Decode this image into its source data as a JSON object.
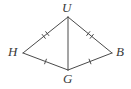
{
  "figure": {
    "type": "geometry-diagram",
    "canvas": {
      "width": 131,
      "height": 89
    },
    "background_color": "#ffffff",
    "stroke_color": "#4a4a4a",
    "label_color": "#3a3a3a",
    "stroke_width": 1,
    "vertices": [
      {
        "id": "U",
        "label": "U",
        "x": 68,
        "y": 17,
        "label_x": 62,
        "label_y": 1
      },
      {
        "id": "H",
        "label": "H",
        "x": 23,
        "y": 53,
        "label_x": 8,
        "label_y": 45
      },
      {
        "id": "B",
        "label": "B",
        "x": 112,
        "y": 53,
        "label_x": 116,
        "label_y": 45
      },
      {
        "id": "G",
        "label": "G",
        "x": 68,
        "y": 70,
        "label_x": 63,
        "label_y": 72
      }
    ],
    "segments": [
      {
        "id": "HU",
        "from": "H",
        "to": "U",
        "ticks": 2
      },
      {
        "id": "UB",
        "from": "U",
        "to": "B",
        "ticks": 2
      },
      {
        "id": "HG",
        "from": "H",
        "to": "G",
        "ticks": 1
      },
      {
        "id": "GB",
        "from": "G",
        "to": "B",
        "ticks": 1
      },
      {
        "id": "UG",
        "from": "U",
        "to": "G",
        "ticks": 0
      }
    ],
    "tick_marks": {
      "double_marked_segments": [
        "HU",
        "UB"
      ],
      "single_marked_segments": [
        "HG",
        "GB"
      ],
      "note": "Congruence hatch marks: two marks on the upper pair of sides, one mark on the lower pair of sides"
    }
  }
}
